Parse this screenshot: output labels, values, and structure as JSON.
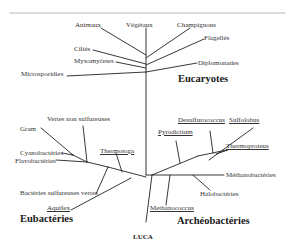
{
  "diagram": {
    "type": "phylogenetic-tree",
    "root": "LUCA",
    "domains": {
      "eukaryotes": {
        "title": "Eucaryotes",
        "taxa": [
          "Animaux",
          "Végétaux",
          "Champignons",
          "Flagellés",
          "Ciliés",
          "Myxomyčetes",
          "Diplomonades",
          "Microsporidies"
        ]
      },
      "eubacteria": {
        "title": "Eubactéries",
        "taxa": [
          "Vertes non sulfureuses",
          "Gram",
          "Cyanobactéries",
          "Flavobactéries",
          "Thermotoga",
          "Bactéries sulfureuses vertes",
          "Aquifex"
        ]
      },
      "archaea": {
        "title": "Archéobactéries",
        "taxa": [
          "Desulfurococcus",
          "Sulfolobus",
          "Pyrodictium",
          "Thermoproteus",
          "Méthanobactéries",
          "Halobactéries",
          "Methanococcus"
        ]
      }
    }
  },
  "labels": {
    "animaux": "Animaux",
    "vegetaux": "Végétaux",
    "champignons": "Champignons",
    "flagelles": "Flagellés",
    "cilies": "Ciliés",
    "myxomycetes": "Myxomyčetes",
    "diplomonades": "Diplomonades",
    "microsporidies": "Microsporidies",
    "eucaryotes": "Eucaryotes",
    "vertes_non_sulfureuses": "Vertes non sulfureuses",
    "gram": "Gram",
    "cyanobacteries": "Cyanobactéries",
    "flavobacteries": "Flavobactéries",
    "thermotoga": "Thermotoga",
    "bacteries_sulfureuses_vertes": "Bactéries sulfureuses vertes",
    "aquifex": "Aquifex",
    "eubacteries": "Eubactéries",
    "desulfurococcus": "Desulfurococcus",
    "sulfolobus": "Sulfolobus",
    "pyrodictium": "Pyrodictium",
    "thermoproteus": "Thermoproteus",
    "methanobacteries": "Méthanobactéries",
    "halobacteries": "Halobactéries",
    "methanococcus": "Methanococcus",
    "archeobacteries": "Archéobactéries",
    "luca": "LUCA"
  }
}
